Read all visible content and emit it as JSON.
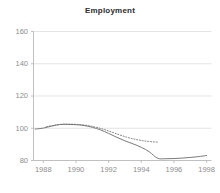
{
  "chart_data": {
    "type": "line",
    "title": "Employment",
    "xlabel": "",
    "ylabel": "",
    "xlim": [
      1987.4,
      1998.3
    ],
    "ylim": [
      80,
      160
    ],
    "grid": true,
    "grid_axis": "y",
    "legend": "none",
    "xticks": [
      1988,
      1990,
      1992,
      1994,
      1996,
      1998
    ],
    "xtick_labels": [
      "1988",
      "1990",
      "1992",
      "1994",
      "1996",
      "1998"
    ],
    "yticks": [
      80,
      100,
      120,
      140,
      160
    ],
    "ytick_labels": [
      "80",
      "100",
      "120",
      "140",
      "160"
    ],
    "series": [
      {
        "name": "actual",
        "style": "solid",
        "color": "#7a7a7a",
        "x": [
          1987.5,
          1988.0,
          1988.5,
          1989.0,
          1989.5,
          1990.0,
          1990.5,
          1991.0,
          1991.5,
          1992.0,
          1992.5,
          1993.0,
          1993.5,
          1994.0,
          1994.5,
          1995.0,
          1995.5,
          1996.0,
          1996.5,
          1997.0,
          1997.5,
          1998.0
        ],
        "values": [
          99.5,
          100.1,
          101.3,
          102.3,
          102.4,
          102.2,
          101.7,
          100.6,
          99.0,
          96.8,
          94.4,
          92.2,
          90.3,
          88.2,
          85.3,
          81.4,
          81.1,
          81.2,
          81.5,
          81.9,
          82.4,
          83.1
        ]
      },
      {
        "name": "trend",
        "style": "dotted",
        "color": "#6f6f6f",
        "x": [
          1988.2,
          1988.7,
          1989.2,
          1989.7,
          1990.2,
          1990.7,
          1991.2,
          1991.7,
          1992.2,
          1992.7,
          1993.2,
          1993.7,
          1994.2,
          1994.7,
          1995.0
        ],
        "values": [
          101.0,
          101.9,
          102.5,
          102.5,
          102.3,
          101.7,
          100.7,
          99.3,
          97.6,
          95.8,
          94.2,
          93.0,
          92.1,
          91.6,
          91.4
        ]
      }
    ],
    "colors": {
      "axis": "#b9b9b9",
      "grid": "#d8d8d8",
      "tick_text": "#8d8d8d",
      "title_text": "#2b2b2b",
      "background": "#ffffff"
    }
  }
}
